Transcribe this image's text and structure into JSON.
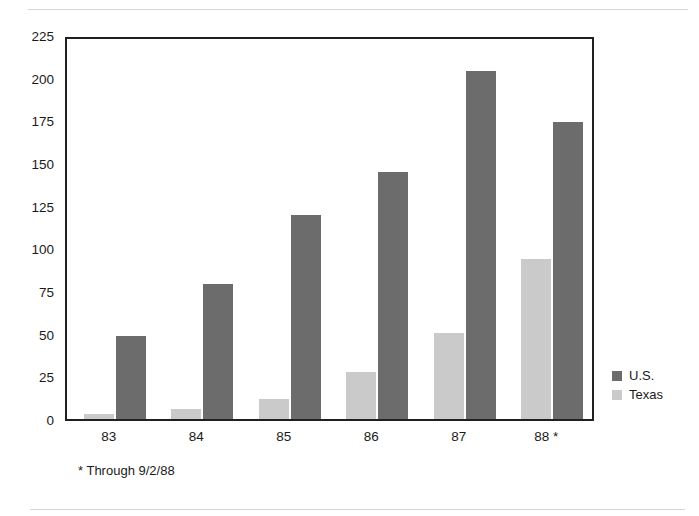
{
  "chart_data": {
    "type": "bar",
    "title": "",
    "subtitle": "",
    "xlabel": "",
    "ylabel": "",
    "categories": [
      "83",
      "84",
      "85",
      "86",
      "87",
      "88 *"
    ],
    "series": [
      {
        "name": "Texas",
        "color": "#cacaca",
        "values": [
          3,
          6,
          12,
          28,
          51,
          95
        ]
      },
      {
        "name": "U.S.",
        "color": "#6c6c6c",
        "values": [
          49,
          80,
          121,
          146,
          206,
          176
        ]
      }
    ],
    "ylim": [
      0,
      225
    ],
    "yticks": [
      0,
      25,
      50,
      75,
      100,
      125,
      150,
      175,
      200,
      225
    ],
    "ytick_labels": [
      "0",
      "25",
      "50",
      "75",
      "100",
      "125",
      "150",
      "175",
      "200",
      "225"
    ],
    "grid": false,
    "legend_position": "right",
    "legend": [
      "U.S.",
      "Texas"
    ],
    "annotations": [
      "* Through 9/2/88"
    ],
    "frame": true
  },
  "legend": {
    "items": [
      {
        "label": "U.S.",
        "series": "us"
      },
      {
        "label": "Texas",
        "series": "texas"
      }
    ]
  },
  "footnote": {
    "text": "* Through 9/2/88"
  },
  "colors": {
    "us_bar": "#6c6c6c",
    "texas_bar": "#cacaca",
    "axis": "#231f20",
    "text": "#1a1a1a",
    "page_rule": "#d6d6d8"
  }
}
